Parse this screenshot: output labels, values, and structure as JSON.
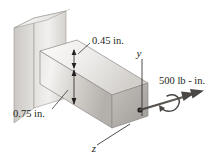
{
  "figure": {
    "background_color": "#ffffff",
    "line_color": "#231f20"
  },
  "dimensions": [
    {
      "id": "width-dim",
      "label": "0.45 in.",
      "name": "beam-width-dimension",
      "description": "Short vertical dimension at top front edge of beam"
    },
    {
      "id": "depth-dim",
      "label": "0.75 in.",
      "name": "beam-depth-dimension",
      "description": "Tall vertical dimension on front face of beam"
    }
  ],
  "axes": [
    {
      "id": "y-axis",
      "label": "y",
      "name": "y-axis-label",
      "orientation": "vertical-up"
    },
    {
      "id": "z-axis",
      "label": "z",
      "name": "z-axis-label",
      "orientation": "diagonal-down-left"
    }
  ],
  "loads": [
    {
      "id": "moment-load",
      "label": "500 lb - in.",
      "name": "applied-moment-label",
      "type": "torsional-moment",
      "magnitude": 500,
      "units": "lb - in.",
      "description": "Double-headed vector along beam axis with curved rotation arrow"
    }
  ],
  "bodies": {
    "wall": {
      "name": "wall-support",
      "fill_light": "#efeeec",
      "fill_mid": "#dcdad7",
      "fill_dark": "#c9c6c2"
    },
    "beam": {
      "name": "cantilever-beam",
      "fill_top": "#f2f1ef",
      "fill_front_light": "#e8e6e3",
      "fill_front_dark": "#b9b6b2",
      "fill_end": "#a9a6a2"
    }
  }
}
